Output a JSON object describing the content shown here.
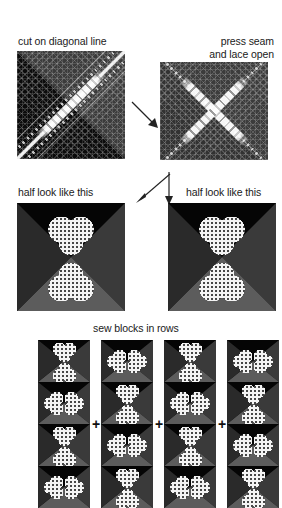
{
  "page": {
    "background": "#ffffff",
    "width": 282,
    "height": 508
  },
  "steps": [
    {
      "id": "step-1",
      "caption": "cut on diagonal line",
      "caption_align": "left",
      "image_alt": "dark fabric square with white diagonal cutting line and lace strips"
    },
    {
      "id": "step-2",
      "caption": "press seam\nand lace open",
      "caption_align": "right",
      "image_alt": "fabric square with X shaped lace pressed open"
    },
    {
      "id": "step-3",
      "caption": "half look like this",
      "caption_align": "left",
      "image_alt": "block with polka dot heart pointing up and heart pointing down"
    },
    {
      "id": "step-4",
      "caption": "half look like this",
      "caption_align": "left",
      "image_alt": "block with polka dot heart pointing up and heart pointing down"
    }
  ],
  "assembly": {
    "caption": "sew blocks in rows",
    "join_symbol": "+",
    "join_count": 3,
    "columns": [
      {
        "id": "column-1",
        "blocks": [
          "bowtie-horizontal",
          "bowtie-horizontal",
          "bowtie-horizontal",
          "bowtie-horizontal"
        ]
      },
      {
        "id": "column-2",
        "blocks": [
          "bowtie-vertical",
          "bowtie-horizontal",
          "bowtie-horizontal",
          "bowtie-vertical"
        ]
      },
      {
        "id": "column-3",
        "blocks": [
          "bowtie-horizontal",
          "bowtie-horizontal",
          "bowtie-horizontal",
          "bowtie-horizontal"
        ]
      },
      {
        "id": "column-4",
        "blocks": [
          "bowtie-horizontal",
          "bowtie-horizontal",
          "bowtie-horizontal",
          "bowtie-vertical"
        ]
      }
    ]
  },
  "arrows": [
    {
      "id": "arrow-step1-to-step2",
      "direction": "down-right"
    },
    {
      "id": "arrow-step2-to-step3",
      "direction": "down-left"
    },
    {
      "id": "arrow-step2-to-step4",
      "direction": "down"
    }
  ],
  "colors": {
    "background": "#ffffff",
    "text": "#1a1a1a",
    "fabric_dark": "#070707",
    "fabric_mid": "#3a3a3a",
    "fabric_light": "#5c5c5c",
    "lace_white": "#f4f4f4"
  }
}
